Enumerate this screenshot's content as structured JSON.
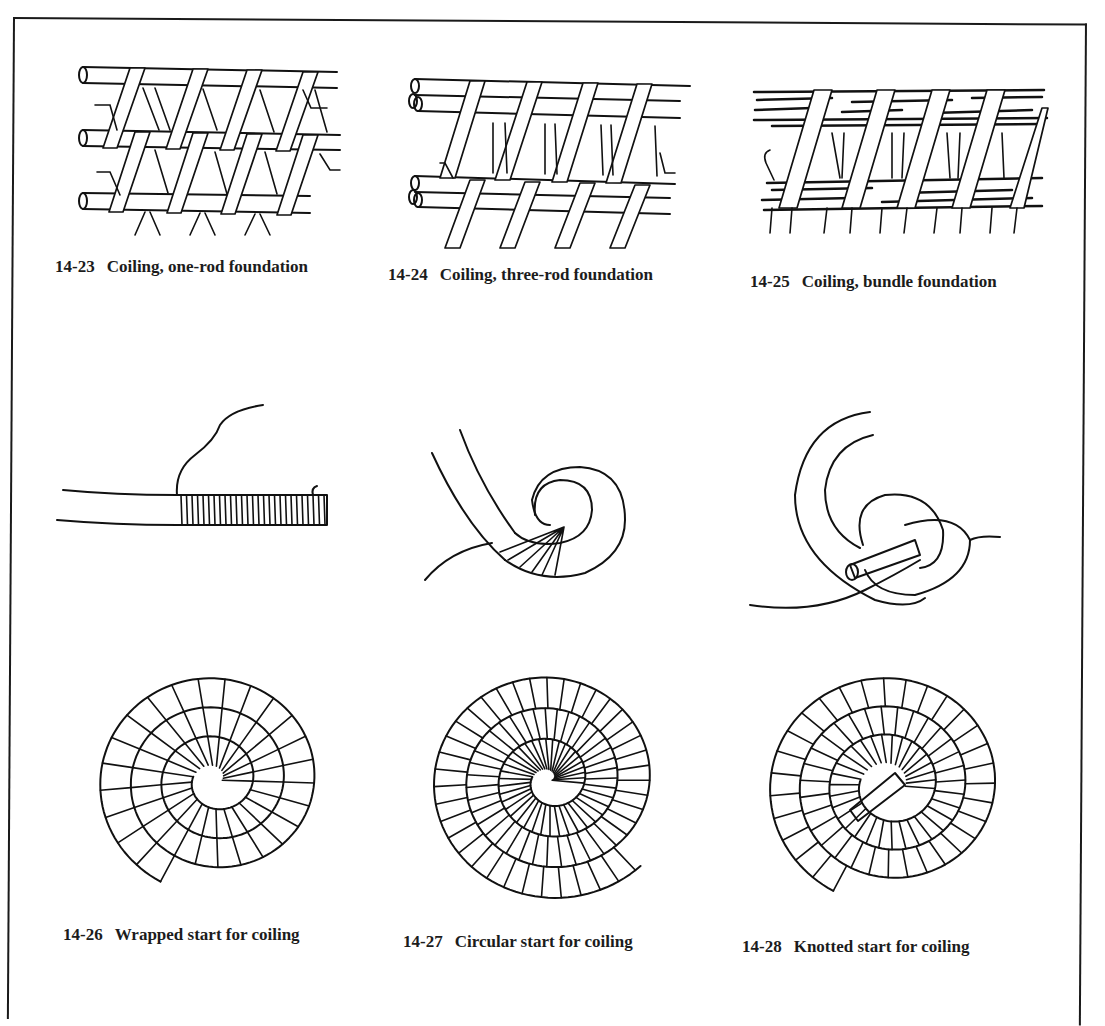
{
  "figures": [
    {
      "number": "14-23",
      "title": "Coiling, one-rod foundation",
      "icon": "one-rod-coil-drawing"
    },
    {
      "number": "14-24",
      "title": "Coiling, three-rod foundation",
      "icon": "three-rod-coil-drawing"
    },
    {
      "number": "14-25",
      "title": "Coiling, bundle foundation",
      "icon": "bundle-coil-drawing"
    },
    {
      "number": "14-26",
      "title": "Wrapped start for coiling",
      "icon": "wrapped-start-drawing"
    },
    {
      "number": "14-27",
      "title": "Circular start for coiling",
      "icon": "circular-start-drawing"
    },
    {
      "number": "14-28",
      "title": "Knotted start for coiling",
      "icon": "knotted-start-drawing"
    }
  ],
  "colors": {
    "ink": "#111111",
    "paper": "#ffffff"
  }
}
